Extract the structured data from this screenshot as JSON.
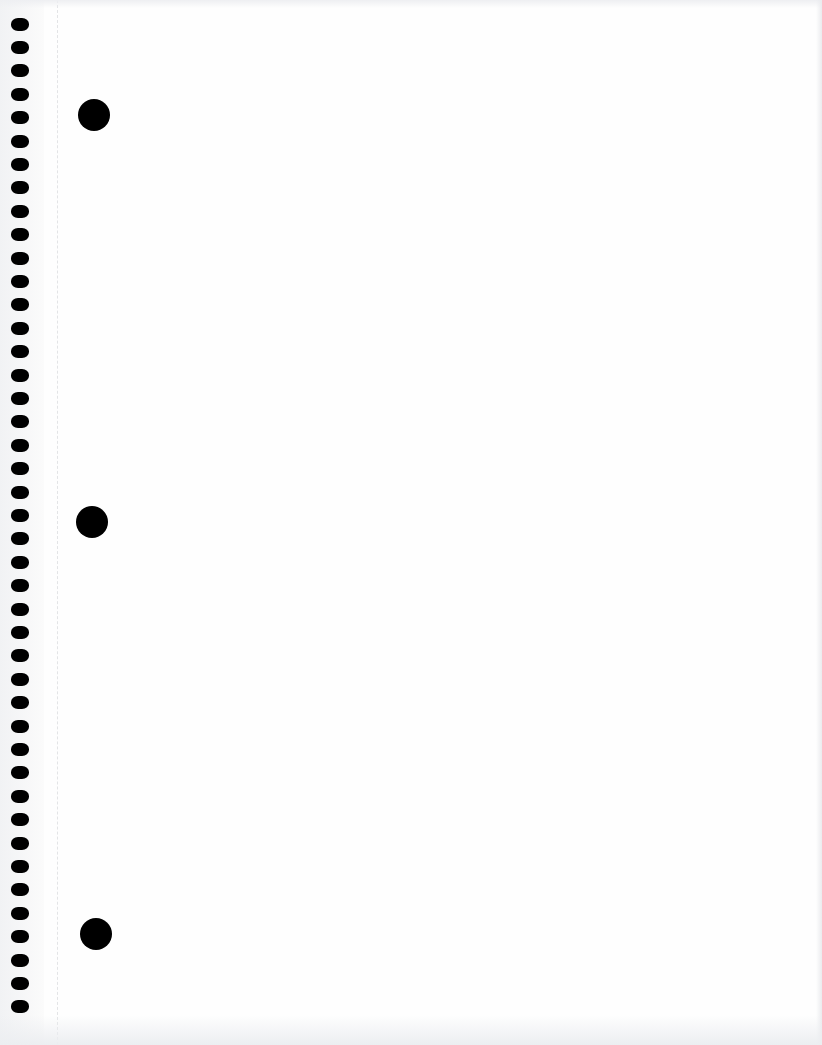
{
  "page": {
    "type": "blank spiral notebook page (scan)",
    "background_color": "#fefefe",
    "content_text": ""
  },
  "spiral": {
    "hole_count": 43,
    "hole_color": "#000000",
    "first_hole_center_y": 24,
    "spacing_px": 23.4,
    "center_x": 20
  },
  "perforation_line": {
    "x": 57,
    "style": "dashed",
    "color": "#e3e4e6"
  },
  "punch_holes": [
    {
      "name": "top",
      "cx": 94,
      "cy": 115,
      "diameter": 32
    },
    {
      "name": "middle",
      "cx": 92,
      "cy": 522,
      "diameter": 32
    },
    {
      "name": "bottom",
      "cx": 96,
      "cy": 934,
      "diameter": 32
    }
  ]
}
